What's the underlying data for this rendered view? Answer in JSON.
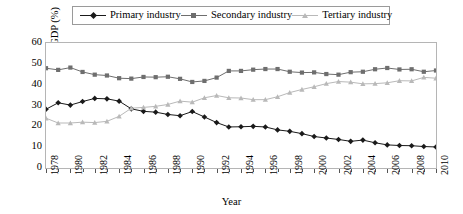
{
  "chart_data": {
    "type": "line",
    "title": "",
    "xlabel": "Year",
    "ylabel": "Composition of GDP (%)",
    "xlim": [
      1978,
      2010
    ],
    "ylim": [
      0,
      60
    ],
    "grid": false,
    "legend_position": "top-center",
    "y_ticks": [
      0,
      10,
      20,
      30,
      40,
      50,
      60
    ],
    "x_ticks": [
      1978,
      1980,
      1982,
      1984,
      1986,
      1988,
      1990,
      1992,
      1994,
      1996,
      1998,
      2000,
      2002,
      2004,
      2006,
      2008,
      2010
    ],
    "x": [
      1978,
      1979,
      1980,
      1981,
      1982,
      1983,
      1984,
      1985,
      1986,
      1987,
      1988,
      1989,
      1990,
      1991,
      1992,
      1993,
      1994,
      1995,
      1996,
      1997,
      1998,
      1999,
      2000,
      2001,
      2002,
      2003,
      2004,
      2005,
      2006,
      2007,
      2008,
      2009,
      2010
    ],
    "series": [
      {
        "name": "Primary industry",
        "color": "#1a1a1a",
        "marker": "diamond",
        "values": [
          28.2,
          31.3,
          30.2,
          31.9,
          33.4,
          33.2,
          32.1,
          28.4,
          27.2,
          26.8,
          25.7,
          25.1,
          27.1,
          24.5,
          21.8,
          19.7,
          19.8,
          20.0,
          19.7,
          18.3,
          17.6,
          16.5,
          15.1,
          14.4,
          13.7,
          12.8,
          13.4,
          12.1,
          11.1,
          10.8,
          10.7,
          10.3,
          10.1
        ]
      },
      {
        "name": "Secondary industry",
        "color": "#6e6e6e",
        "marker": "square",
        "values": [
          47.9,
          47.1,
          48.2,
          46.1,
          44.8,
          44.4,
          43.1,
          42.9,
          43.7,
          43.6,
          43.8,
          42.8,
          41.3,
          41.8,
          43.4,
          46.6,
          46.6,
          47.2,
          47.5,
          47.5,
          46.2,
          45.8,
          45.9,
          45.1,
          44.8,
          46.0,
          46.2,
          47.4,
          48.0,
          47.3,
          47.4,
          46.2,
          46.8
        ]
      },
      {
        "name": "Tertiary industry",
        "color": "#b9b9b9",
        "marker": "triangle",
        "values": [
          23.9,
          21.6,
          21.6,
          22.0,
          21.8,
          22.4,
          24.8,
          28.7,
          29.1,
          29.6,
          30.5,
          32.1,
          31.6,
          33.7,
          34.8,
          33.7,
          33.6,
          32.8,
          32.8,
          34.2,
          36.2,
          37.7,
          39.0,
          40.5,
          41.5,
          41.2,
          40.4,
          40.5,
          40.9,
          41.9,
          41.8,
          43.5,
          43.1
        ]
      }
    ]
  },
  "legend": {
    "entries": [
      {
        "label": "Primary industry"
      },
      {
        "label": "Secondary industry"
      },
      {
        "label": "Tertiary industry"
      }
    ]
  },
  "axes": {
    "y_title": "Composition of GDP (%)",
    "x_title": "Year"
  }
}
